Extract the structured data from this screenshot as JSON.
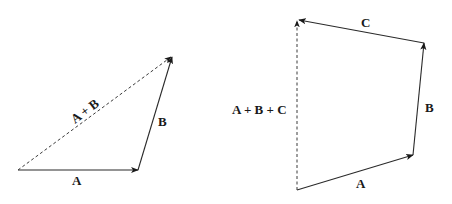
{
  "diagrams": [
    {
      "name": "two-vector-sum",
      "vectors": [
        {
          "label": "A",
          "from": [
            18,
            170
          ],
          "to": [
            138,
            170
          ],
          "style": "solid"
        },
        {
          "label": "B",
          "from": [
            138,
            170
          ],
          "to": [
            172,
            57
          ],
          "style": "solid"
        },
        {
          "label": "A + B",
          "from": [
            18,
            170
          ],
          "to": [
            172,
            57
          ],
          "style": "dashed"
        }
      ]
    },
    {
      "name": "three-vector-sum",
      "vectors": [
        {
          "label": "A",
          "from": [
            297,
            190
          ],
          "to": [
            413,
            155
          ],
          "style": "solid"
        },
        {
          "label": "B",
          "from": [
            413,
            155
          ],
          "to": [
            424,
            43
          ],
          "style": "solid"
        },
        {
          "label": "C",
          "from": [
            424,
            43
          ],
          "to": [
            298,
            20
          ],
          "style": "solid"
        },
        {
          "label": "A + B + C",
          "from": [
            297,
            190
          ],
          "to": [
            297,
            20
          ],
          "style": "dashed"
        }
      ]
    }
  ],
  "labels": {
    "left_a": "A",
    "left_b": "B",
    "left_sum": "A + B",
    "right_a": "A",
    "right_b": "B",
    "right_c": "C",
    "right_sum": "A + B + C"
  }
}
